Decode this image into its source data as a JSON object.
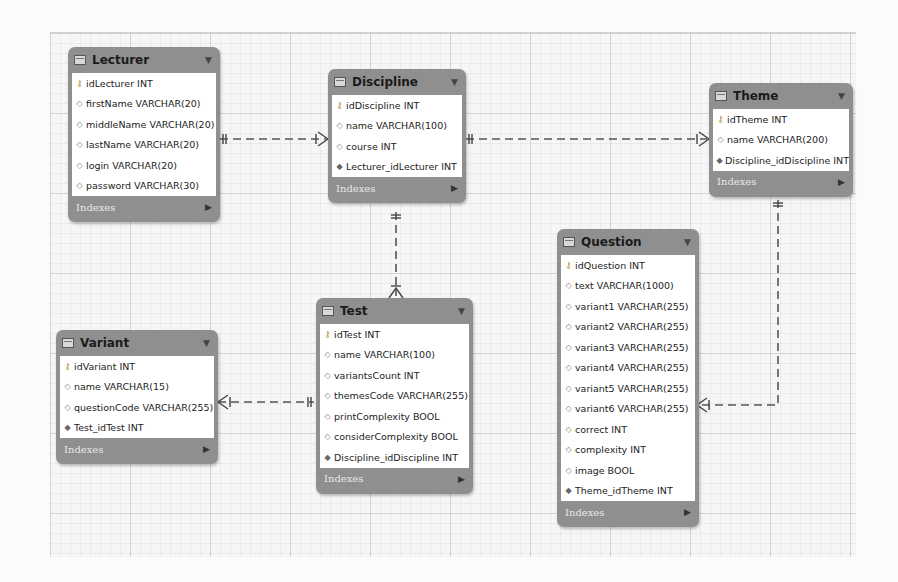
{
  "diagram": {
    "tables": [
      {
        "id": "lecturer",
        "name": "Lecturer",
        "columns": [
          {
            "kind": "pk",
            "text": "idLecturer INT"
          },
          {
            "kind": "col",
            "text": "firstName VARCHAR(20)"
          },
          {
            "kind": "col",
            "text": "middleName VARCHAR(20)"
          },
          {
            "kind": "col",
            "text": "lastName VARCHAR(20)"
          },
          {
            "kind": "col",
            "text": "login VARCHAR(20)"
          },
          {
            "kind": "col",
            "text": "password VARCHAR(30)"
          }
        ],
        "footer": "Indexes"
      },
      {
        "id": "discipline",
        "name": "Discipline",
        "columns": [
          {
            "kind": "pk",
            "text": "idDiscipline INT"
          },
          {
            "kind": "col",
            "text": "name VARCHAR(100)"
          },
          {
            "kind": "col",
            "text": "course INT"
          },
          {
            "kind": "fk",
            "text": "Lecturer_idLecturer INT"
          }
        ],
        "footer": "Indexes"
      },
      {
        "id": "theme",
        "name": "Theme",
        "columns": [
          {
            "kind": "pk",
            "text": "idTheme INT"
          },
          {
            "kind": "col",
            "text": "name VARCHAR(200)"
          },
          {
            "kind": "fk",
            "text": "Discipline_idDiscipline INT"
          }
        ],
        "footer": "Indexes"
      },
      {
        "id": "question",
        "name": "Question",
        "columns": [
          {
            "kind": "pk",
            "text": "idQuestion INT"
          },
          {
            "kind": "col",
            "text": "text VARCHAR(1000)"
          },
          {
            "kind": "col",
            "text": "variant1 VARCHAR(255)"
          },
          {
            "kind": "col",
            "text": "variant2 VARCHAR(255)"
          },
          {
            "kind": "col",
            "text": "variant3 VARCHAR(255)"
          },
          {
            "kind": "col",
            "text": "variant4 VARCHAR(255)"
          },
          {
            "kind": "col",
            "text": "variant5 VARCHAR(255)"
          },
          {
            "kind": "col",
            "text": "variant6 VARCHAR(255)"
          },
          {
            "kind": "col",
            "text": "correct INT"
          },
          {
            "kind": "col",
            "text": "complexity INT"
          },
          {
            "kind": "col",
            "text": "image BOOL"
          },
          {
            "kind": "fk",
            "text": "Theme_idTheme INT"
          }
        ],
        "footer": "Indexes"
      },
      {
        "id": "test",
        "name": "Test",
        "columns": [
          {
            "kind": "pk",
            "text": "idTest INT"
          },
          {
            "kind": "col",
            "text": "name VARCHAR(100)"
          },
          {
            "kind": "col",
            "text": "variantsCount INT"
          },
          {
            "kind": "col",
            "text": "themesCode VARCHAR(255)"
          },
          {
            "kind": "col",
            "text": "printComplexity BOOL"
          },
          {
            "kind": "col",
            "text": "considerComplexity BOOL"
          },
          {
            "kind": "fk",
            "text": "Discipline_idDiscipline INT"
          }
        ],
        "footer": "Indexes"
      },
      {
        "id": "variant",
        "name": "Variant",
        "columns": [
          {
            "kind": "pk",
            "text": "idVariant INT"
          },
          {
            "kind": "col",
            "text": "name VARCHAR(15)"
          },
          {
            "kind": "col",
            "text": "questionCode VARCHAR(255)"
          },
          {
            "kind": "fk",
            "text": "Test_idTest INT"
          }
        ],
        "footer": "Indexes"
      }
    ],
    "relationships": [
      {
        "from": "Lecturer",
        "to": "Discipline",
        "type": "one-to-many"
      },
      {
        "from": "Discipline",
        "to": "Theme",
        "type": "one-to-many"
      },
      {
        "from": "Discipline",
        "to": "Test",
        "type": "one-to-many"
      },
      {
        "from": "Theme",
        "to": "Question",
        "type": "one-to-many"
      },
      {
        "from": "Test",
        "to": "Variant",
        "type": "one-to-many"
      }
    ],
    "icons": {
      "pk": "key-icon",
      "col": "diamond-outline-icon",
      "fk": "diamond-filled-icon",
      "table": "table-icon",
      "menu": "chevron-down-icon",
      "footer_arrow": "triangle-right-icon"
    },
    "colors": {
      "table_frame": "#8f8f8f",
      "table_body": "#ffffff",
      "line": "#555555",
      "canvas": "#f6f6f6"
    }
  }
}
